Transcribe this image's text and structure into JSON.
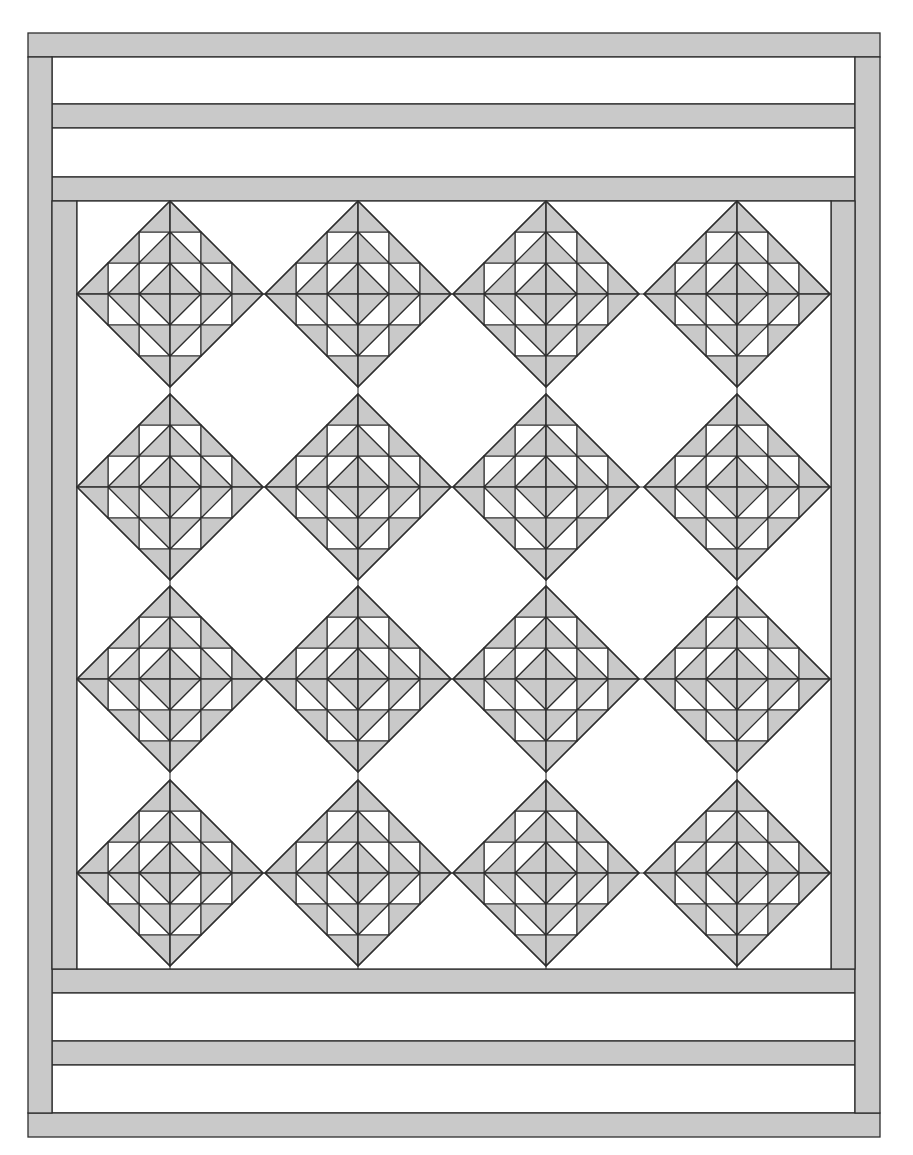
{
  "diagram": {
    "type": "quilt-layout",
    "colors": {
      "fabric_gray": "#c9c9c9",
      "fabric_white": "#ffffff",
      "seam_line": "#2e2e2e",
      "background": "#ffffff"
    },
    "outer_frame": {
      "x": 28,
      "y": 33,
      "width": 852,
      "height": 1103
    },
    "border_width": 24,
    "top_section": {
      "strips": [
        {
          "kind": "gray",
          "y": 33,
          "h": 24,
          "x": 28,
          "w": 852
        },
        {
          "kind": "white",
          "y": 57,
          "h": 47,
          "x": 52,
          "w": 803
        },
        {
          "kind": "gray",
          "y": 104,
          "h": 24,
          "x": 52,
          "w": 803
        },
        {
          "kind": "white",
          "y": 128,
          "h": 49,
          "x": 52,
          "w": 803
        },
        {
          "kind": "gray",
          "y": 177,
          "h": 24,
          "x": 52,
          "w": 803
        }
      ]
    },
    "side_borders": [
      {
        "name": "left-outer-border",
        "x": 28,
        "y": 57,
        "w": 24,
        "h": 1056
      },
      {
        "name": "right-outer-border",
        "x": 855,
        "y": 57,
        "w": 25,
        "h": 1056
      },
      {
        "name": "left-inner-border",
        "x": 52,
        "y": 201,
        "w": 25,
        "h": 768
      },
      {
        "name": "right-inner-border",
        "x": 831,
        "y": 201,
        "w": 24,
        "h": 768
      }
    ],
    "bottom_section": {
      "strips": [
        {
          "kind": "gray",
          "y": 969,
          "h": 24,
          "x": 52,
          "w": 803
        },
        {
          "kind": "white",
          "y": 993,
          "h": 48,
          "x": 52,
          "w": 803
        },
        {
          "kind": "gray",
          "y": 1041,
          "h": 24,
          "x": 52,
          "w": 803
        },
        {
          "kind": "white",
          "y": 1065,
          "h": 48,
          "x": 52,
          "w": 803
        },
        {
          "kind": "gray",
          "y": 1113,
          "h": 24,
          "x": 28,
          "w": 852
        }
      ]
    },
    "center_field": {
      "x": 77,
      "y": 201,
      "w": 754,
      "h": 768
    },
    "blocks": {
      "name": "Ocean Waves style diamond block (on point)",
      "rows": 4,
      "cols": 4,
      "center_x": [
        170,
        358,
        546,
        737
      ],
      "center_y": [
        294,
        487,
        679,
        873
      ],
      "unit": 31,
      "half_diagonal_units": 3
    }
  },
  "caption": {
    "top_text_partial": ""
  }
}
